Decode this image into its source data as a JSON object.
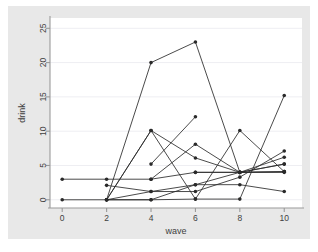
{
  "chart_data": {
    "type": "line",
    "title": "",
    "subtitle": "",
    "xlabel": "wave",
    "ylabel": "drink",
    "xlim": [
      -0.55,
      10.8
    ],
    "ylim": [
      -1.2,
      26.5
    ],
    "xticks": [
      0,
      2,
      4,
      6,
      8,
      10
    ],
    "yticks": [
      0,
      5,
      10,
      15,
      20,
      25
    ],
    "xticklabels": [
      "0",
      "2",
      "4",
      "6",
      "8",
      "10"
    ],
    "yticklabels": [
      "0",
      "5",
      "10",
      "15",
      "20",
      "25"
    ],
    "grid": "horizontal",
    "legend": "none",
    "markers": "filled-circle",
    "line_color": "#2a2a2a",
    "marker_color": "#2a2a2a",
    "grid_color": "#eeeef2",
    "plot_bg": "#ffffff",
    "figure_bg": "#e8e8e8",
    "page_bg": "#ffffff",
    "x": [
      0,
      2,
      4,
      6,
      8,
      10
    ],
    "series": [
      {
        "name": "id-1",
        "x": [
          0,
          2,
          4,
          6,
          8,
          10
        ],
        "values": [
          3,
          3,
          3,
          4,
          4,
          4
        ]
      },
      {
        "name": "id-2",
        "x": [
          0,
          2,
          4,
          6,
          8,
          10
        ],
        "values": [
          0,
          0,
          0,
          2.2,
          4,
          5.2
        ]
      },
      {
        "name": "id-3",
        "x": [
          2,
          4,
          6,
          8,
          10
        ],
        "values": [
          0,
          20,
          23,
          4,
          5.2
        ]
      },
      {
        "name": "id-4",
        "x": [
          2,
          4,
          6,
          8,
          10
        ],
        "values": [
          2.1,
          1.2,
          1.2,
          3.3,
          7.1
        ]
      },
      {
        "name": "id-5",
        "x": [
          2,
          4,
          6,
          8,
          10
        ],
        "values": [
          0,
          10.1,
          0.1,
          10.1,
          4.1
        ]
      },
      {
        "name": "id-6",
        "x": [
          2,
          4,
          6,
          8,
          10
        ],
        "values": [
          0,
          10.1,
          6.1,
          4,
          6.2
        ]
      },
      {
        "name": "id-7",
        "x": [
          4,
          6
        ],
        "values": [
          5.2,
          12.1
        ]
      },
      {
        "name": "id-8",
        "x": [
          4,
          6,
          8,
          10
        ],
        "values": [
          3,
          8.1,
          4,
          4.1
        ]
      },
      {
        "name": "id-9",
        "x": [
          2,
          4,
          6,
          8,
          10
        ],
        "values": [
          0,
          0,
          0.1,
          0.1,
          15.2
        ]
      },
      {
        "name": "id-10",
        "x": [
          2,
          4,
          6,
          8,
          10
        ],
        "values": [
          0,
          1.2,
          2.2,
          2.2,
          1.2
        ]
      },
      {
        "name": "id-11",
        "x": [
          6,
          8,
          10
        ],
        "values": [
          4,
          4,
          4.1
        ]
      }
    ]
  }
}
